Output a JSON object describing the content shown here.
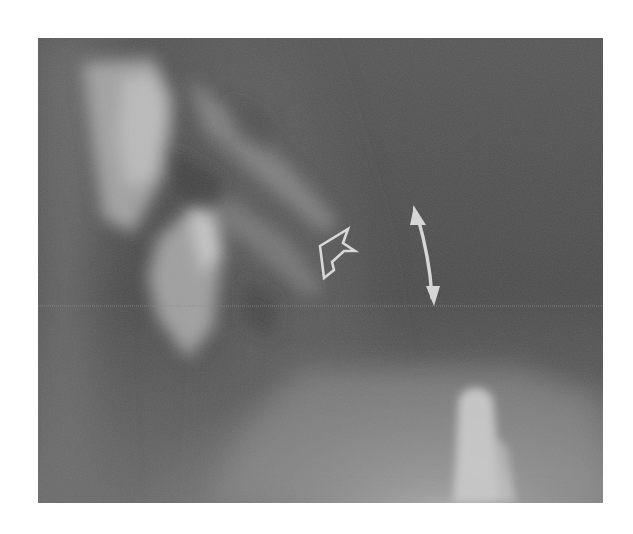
{
  "figure": {
    "type": "radiograph",
    "modality": "X-ray",
    "view": "lateral cervical spine",
    "palette": {
      "background": "#ffffff",
      "film_base": "#5a5a5a",
      "film_dark": "#4a4a4a",
      "bone_bright": "#c8c8c8",
      "annotation": "#d8d8d8"
    },
    "annotations": [
      {
        "kind": "open-arrowhead",
        "icon": "open-arrow-icon",
        "points_to": "upper-left",
        "approx_position": [
          333,
          255
        ]
      },
      {
        "kind": "double-headed-arrow",
        "icon": "double-arrow-icon",
        "from": [
          413,
          205
        ],
        "to": [
          433,
          300
        ]
      }
    ]
  }
}
